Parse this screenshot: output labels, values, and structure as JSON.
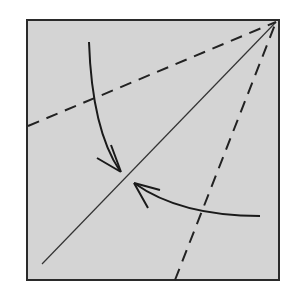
{
  "diagram": {
    "type": "origami-fold-step",
    "paper": {
      "fill": "#d4d4d4",
      "stroke": "#2a2a2a",
      "x": 27,
      "y": 20,
      "size": 252
    },
    "lines": [
      {
        "name": "diagonal-crease",
        "style": "solid-thin",
        "from": [
          42,
          264
        ],
        "to": [
          276,
          22
        ]
      },
      {
        "name": "valley-fold-upper",
        "style": "dashed",
        "from": [
          28,
          126
        ],
        "to": [
          276,
          22
        ]
      },
      {
        "name": "valley-fold-lower",
        "style": "dashed",
        "from": [
          175,
          280
        ],
        "to": [
          276,
          22
        ]
      }
    ],
    "arrows": [
      {
        "name": "fold-arrow-top-edge",
        "from": [
          89,
          42
        ],
        "to": [
          120,
          172
        ]
      },
      {
        "name": "fold-arrow-right-edge",
        "from": [
          260,
          215
        ],
        "to": [
          134,
          183
        ]
      }
    ]
  }
}
